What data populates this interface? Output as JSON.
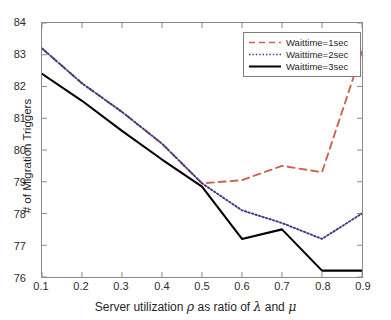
{
  "chart_data": {
    "type": "line",
    "title": "",
    "xlabel": "Server utilization ρ as ratio of λ and μ",
    "ylabel": "# of Migration Triggers",
    "xlim": [
      0.1,
      0.9
    ],
    "ylim": [
      76,
      84
    ],
    "grid": false,
    "legend_position": "top-right",
    "xticks": [
      "0.1",
      "0.2",
      "0.3",
      "0.4",
      "0.5",
      "0.6",
      "0.7",
      "0.8",
      "0.9"
    ],
    "yticks": [
      "76",
      "77",
      "78",
      "79",
      "80",
      "81",
      "82",
      "83",
      "84"
    ],
    "x": [
      0.1,
      0.2,
      0.3,
      0.4,
      0.5,
      0.6,
      0.7,
      0.8,
      0.9
    ],
    "series": [
      {
        "name": "Waittime=1sec",
        "color": "#D2604A",
        "style": "dashed",
        "values": [
          83.2,
          82.1,
          81.2,
          80.2,
          78.95,
          79.05,
          79.5,
          79.3,
          83.1
        ]
      },
      {
        "name": "Waittime=2sec",
        "color": "#3A3A8C",
        "style": "dotted",
        "values": [
          83.2,
          82.1,
          81.2,
          80.2,
          78.95,
          78.1,
          77.7,
          77.2,
          78.0
        ]
      },
      {
        "name": "Waittime=3sec",
        "color": "#000000",
        "style": "solid",
        "values": [
          82.4,
          81.55,
          80.6,
          79.7,
          78.85,
          77.2,
          77.5,
          76.2,
          76.2
        ]
      }
    ]
  },
  "axes": {
    "ylabel": "# of Migration Triggers",
    "xlabel_prefix": "Server utilization ",
    "xlabel_rho": "ρ",
    "xlabel_mid": " as ratio of ",
    "xlabel_lambda": "λ",
    "xlabel_and": " and ",
    "xlabel_mu": "μ"
  },
  "legend": {
    "items": [
      {
        "label": "Waittime=1sec"
      },
      {
        "label": "Waittime=2sec"
      },
      {
        "label": "Waittime=3sec"
      }
    ]
  }
}
